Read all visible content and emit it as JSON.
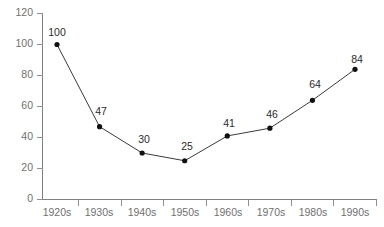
{
  "chart_data": {
    "type": "line",
    "title": "",
    "subtitle": "",
    "xlabel": "",
    "ylabel": "",
    "categories": [
      "1920s",
      "1930s",
      "1940s",
      "1950s",
      "1960s",
      "1970s",
      "1980s",
      "1990s"
    ],
    "values": [
      100,
      47,
      30,
      25,
      41,
      46,
      64,
      84
    ],
    "point_labels": [
      "100",
      "47",
      "30",
      "25",
      "41",
      "46",
      "64",
      "84"
    ],
    "series": [
      {
        "name": "",
        "values": [
          100,
          47,
          30,
          25,
          41,
          46,
          64,
          84
        ]
      }
    ],
    "ylim": [
      0,
      120
    ],
    "yticks": [
      0,
      20,
      40,
      60,
      80,
      100,
      120
    ],
    "ytick_labels": [
      "0",
      "20",
      "40",
      "60",
      "80",
      "100",
      "120"
    ],
    "xtick_labels": [
      "1920s",
      "1930s",
      "1940s",
      "1950s",
      "1960s",
      "1970s",
      "1980s",
      "1990s"
    ],
    "grid": false,
    "legend": false,
    "legend_position": "none",
    "marker": "circle",
    "colors": {
      "line": "#3a3a3a",
      "marker": "#111111",
      "axis": "#808080",
      "tick_label": "#6f6f6f",
      "point_label": "#2b2b2b",
      "background": "#ffffff"
    }
  }
}
